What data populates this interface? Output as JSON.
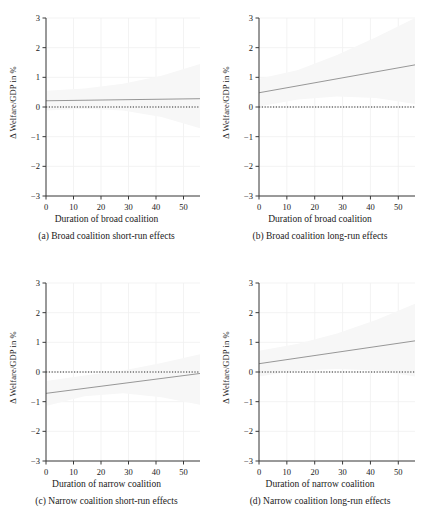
{
  "figure": {
    "panel_count": 4,
    "axis_color": "#3a3a3a",
    "line_color": "#8c8c8c",
    "zero_line_color": "#2b2b2b",
    "grid_color": "#f0f0f0",
    "band_color": "#f7f7f7"
  },
  "axes": {
    "ylabel": "Δ Welfare/GDP in %",
    "yticks": [
      "3",
      "2",
      "1",
      "0",
      "−1",
      "−2",
      "−3"
    ],
    "ytick_values": [
      3,
      2,
      1,
      0,
      -1,
      -2,
      -3
    ],
    "ylim": [
      -3,
      3
    ],
    "xticks": [
      "0",
      "10",
      "20",
      "30",
      "40",
      "50"
    ],
    "xtick_values": [
      0,
      10,
      20,
      30,
      40,
      50
    ],
    "xlim": [
      0,
      56
    ]
  },
  "panels": [
    {
      "key": "a",
      "caption": "(a) Broad coalition short-run effects",
      "xlabel": "Duration of broad coalition"
    },
    {
      "key": "b",
      "caption": "(b) Broad coalition long-run effects",
      "xlabel": "Duration of broad coalition"
    },
    {
      "key": "c",
      "caption": "(c) Narrow coalition short-run effects",
      "xlabel": "Duration of narrow coalition"
    },
    {
      "key": "d",
      "caption": "(d) Narrow coalition long-run effects",
      "xlabel": "Duration of narrow coalition"
    }
  ],
  "chart_data": [
    {
      "type": "line",
      "panel": "a",
      "title": "(a) Broad coalition short-run effects",
      "xlabel": "Duration of broad coalition",
      "ylabel": "Δ Welfare/GDP in %",
      "xlim": [
        0,
        56
      ],
      "ylim": [
        -3,
        3
      ],
      "grid": true,
      "legend": "none",
      "series": [
        {
          "name": "marginal effect",
          "x": [
            0,
            56
          ],
          "values": [
            0.21,
            0.28
          ]
        },
        {
          "name": "zero reference line",
          "style": "dotted",
          "x": [
            0,
            56
          ],
          "values": [
            0,
            0
          ]
        }
      ],
      "confidence_band": {
        "x": [
          0,
          14,
          28,
          42,
          56
        ],
        "upper": [
          0.55,
          0.62,
          0.78,
          1.05,
          1.45
        ],
        "lower": [
          -0.12,
          -0.06,
          -0.12,
          -0.34,
          -0.72
        ]
      }
    },
    {
      "type": "line",
      "panel": "b",
      "title": "(b) Broad coalition long-run effects",
      "xlabel": "Duration of broad coalition",
      "ylabel": "Δ Welfare/GDP in %",
      "xlim": [
        0,
        56
      ],
      "ylim": [
        -3,
        3
      ],
      "grid": true,
      "legend": "none",
      "series": [
        {
          "name": "marginal effect",
          "x": [
            0,
            56
          ],
          "values": [
            0.48,
            1.42
          ]
        },
        {
          "name": "zero reference line",
          "style": "dotted",
          "x": [
            0,
            56
          ],
          "values": [
            0,
            0
          ]
        }
      ],
      "confidence_band": {
        "x": [
          0,
          14,
          28,
          42,
          56
        ],
        "upper": [
          0.95,
          1.25,
          1.75,
          2.35,
          3.0
        ],
        "lower": [
          0.02,
          0.25,
          0.35,
          0.3,
          0.1
        ]
      }
    },
    {
      "type": "line",
      "panel": "c",
      "title": "(c) Narrow coalition short-run effects",
      "xlabel": "Duration of narrow coalition",
      "ylabel": "Δ Welfare/GDP in %",
      "xlim": [
        0,
        56
      ],
      "ylim": [
        -3,
        3
      ],
      "grid": true,
      "legend": "none",
      "series": [
        {
          "name": "marginal effect",
          "x": [
            0,
            56
          ],
          "values": [
            -0.72,
            -0.05
          ]
        },
        {
          "name": "zero reference line",
          "style": "dotted",
          "x": [
            0,
            56
          ],
          "values": [
            0,
            0
          ]
        }
      ],
      "confidence_band": {
        "x": [
          0,
          14,
          28,
          42,
          56
        ],
        "upper": [
          -0.3,
          -0.12,
          0.05,
          0.3,
          0.6
        ],
        "lower": [
          -1.15,
          -0.82,
          -0.72,
          -0.85,
          -1.1
        ]
      }
    },
    {
      "type": "line",
      "panel": "d",
      "title": "(d) Narrow coalition long-run effects",
      "xlabel": "Duration of narrow coalition",
      "ylabel": "Δ Welfare/GDP in %",
      "xlim": [
        0,
        56
      ],
      "ylim": [
        -3,
        3
      ],
      "grid": true,
      "legend": "none",
      "series": [
        {
          "name": "marginal effect",
          "x": [
            0,
            56
          ],
          "values": [
            0.28,
            1.05
          ]
        },
        {
          "name": "zero reference line",
          "style": "dotted",
          "x": [
            0,
            56
          ],
          "values": [
            0,
            0
          ]
        }
      ],
      "confidence_band": {
        "x": [
          0,
          14,
          28,
          42,
          56
        ],
        "upper": [
          0.72,
          0.95,
          1.3,
          1.75,
          2.3
        ],
        "lower": [
          -0.15,
          0.05,
          0.1,
          0.05,
          -0.15
        ]
      }
    }
  ]
}
